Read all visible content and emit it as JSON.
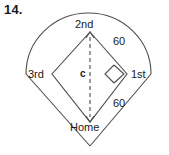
{
  "problem": {
    "number": "14."
  },
  "figure": {
    "type": "baseball-diamond-geometry-diagram",
    "labels": {
      "second_base": "2nd",
      "first_base": "1st",
      "third_base": "3rd",
      "home_plate": "Home",
      "center_segment": "c",
      "side_length_upper": "60",
      "side_length_lower": "60"
    },
    "colors": {
      "stroke": "#4d4d4d",
      "text": "#1a1a1a",
      "background": "#ffffff"
    },
    "geometry": {
      "outfield_arc_left_x": 26,
      "outfield_arc_right_x": 151,
      "outfield_arc_top_y": 13,
      "home_foul_vertex": [
        90,
        146
      ],
      "second_base_point": [
        90,
        32
      ],
      "first_base_point": [
        127,
        74
      ],
      "third_base_point": [
        52,
        74
      ],
      "home_base_point": [
        90,
        122
      ],
      "right_angle_marker_at": "first_base",
      "dashed_segment": "second_base_to_home"
    }
  }
}
